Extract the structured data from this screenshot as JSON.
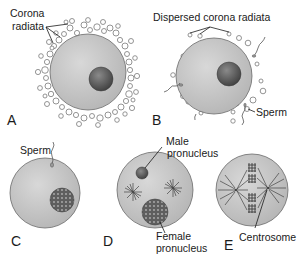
{
  "figure": {
    "background": "#ffffff",
    "colors": {
      "cytoplasm": "#c9c9c9",
      "cytoplasm_stroke": "#6a6a6a",
      "nucleus": "#5a5a5a",
      "corona_cell": "#ffffff",
      "corona_stroke": "#777777",
      "text": "#1a1a1a"
    },
    "panels": [
      {
        "id": "A",
        "letter": "A",
        "labels": {
          "corona": [
            "Corona",
            "radiata"
          ]
        }
      },
      {
        "id": "B",
        "letter": "B",
        "labels": {
          "dispersed": "Dispersed corona radiata",
          "sperm": "Sperm"
        }
      },
      {
        "id": "C",
        "letter": "C",
        "labels": {
          "sperm": "Sperm"
        }
      },
      {
        "id": "D",
        "letter": "D",
        "labels": {
          "male": [
            "Male",
            "pronucleus"
          ],
          "female": [
            "Female",
            "pronucleus"
          ]
        }
      },
      {
        "id": "E",
        "letter": "E",
        "labels": {
          "centrosome": "Centrosome"
        }
      }
    ]
  }
}
